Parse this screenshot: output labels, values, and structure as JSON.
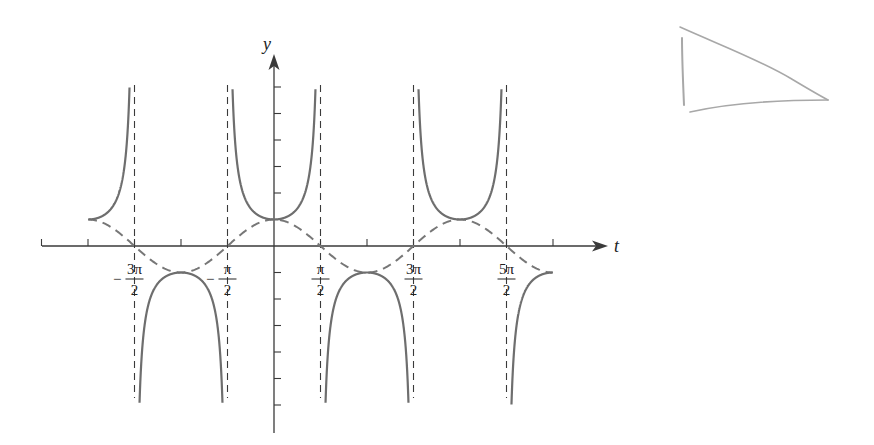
{
  "chart_data": {
    "type": "line",
    "title": "",
    "xlabel": "t",
    "ylabel": "y",
    "series": [
      {
        "name": "y = sec t",
        "style": "solid",
        "function": "sec(t)",
        "domain": [
          -6.2832,
          9.4248
        ]
      },
      {
        "name": "y = cos t",
        "style": "dashed",
        "function": "cos(t)",
        "domain": [
          -6.2832,
          9.4248
        ]
      }
    ],
    "vertical_asymptotes": [
      "-3π/2",
      "-π/2",
      "π/2",
      "3π/2",
      "5π/2"
    ],
    "x_tick_labels": [
      {
        "label": "−3π/2",
        "num": "3π",
        "den": "2",
        "sign": "−",
        "value": -4.7124
      },
      {
        "label": "−π/2",
        "num": "π",
        "den": "2",
        "sign": "−",
        "value": -1.5708
      },
      {
        "label": "π/2",
        "num": "π",
        "den": "2",
        "sign": "",
        "value": 1.5708
      },
      {
        "label": "3π/2",
        "num": "3π",
        "den": "2",
        "sign": "",
        "value": 4.7124
      },
      {
        "label": "5π/2",
        "num": "5π",
        "den": "2",
        "sign": "",
        "value": 7.854
      }
    ],
    "x_ticks_every": "π/2",
    "y_ticks": [
      -6,
      -5,
      -4,
      -3,
      -2,
      -1,
      1,
      2,
      3,
      4,
      5,
      6
    ],
    "xlim": [
      -7.9,
      11.2
    ],
    "ylim": [
      -7.2,
      6.5
    ],
    "grid": false,
    "legend": "none",
    "colors": {
      "curve": "#6e6e6e",
      "dashed": "#777777",
      "axes": "#3a3a3a",
      "sketch": "#a8a8a8"
    },
    "annotations": [
      {
        "type": "hand-drawn triangle",
        "position": "top-right"
      }
    ]
  },
  "labels": {
    "x_axis": "t",
    "y_axis": "y"
  }
}
